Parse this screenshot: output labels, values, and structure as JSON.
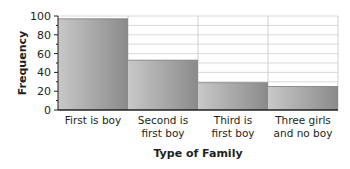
{
  "chart_data": {
    "type": "bar",
    "title": "",
    "xlabel": "Type of Family",
    "ylabel": "Frequency",
    "categories": [
      "First is boy",
      "Second is first boy",
      "Third is first boy",
      "Three girls and no boy"
    ],
    "category_lines": [
      [
        "First is boy"
      ],
      [
        "Second is",
        "first boy"
      ],
      [
        "Third is",
        "first boy"
      ],
      [
        "Three girls",
        "and no boy"
      ]
    ],
    "values": [
      97,
      53,
      29,
      25
    ],
    "ylim": [
      0,
      100
    ],
    "yticks": [
      0,
      20,
      40,
      60,
      80,
      100
    ],
    "grid": {
      "horizontal_step": 10,
      "vertical_separators": true
    },
    "legend": null,
    "colors": {
      "bar_light": "#c8c8c8",
      "bar_dark": "#8a8a8a",
      "grid": "#d9d9d9",
      "axis": "#231f20",
      "frame": "#cfcfcf"
    }
  }
}
